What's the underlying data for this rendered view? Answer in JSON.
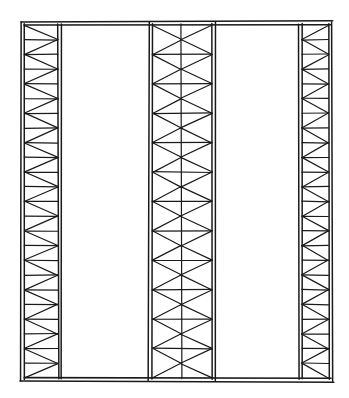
{
  "figure": {
    "description": "Hand-drawn line sketch of a rectangular frame divided by three vertical truss columns",
    "background": "#ffffff",
    "ink_color": "#1a1a1a",
    "canvas": {
      "width": 349,
      "height": 398
    },
    "frame": {
      "left": 21,
      "right": 333,
      "top": 22,
      "bottom": 381,
      "double_line_gap": 3
    },
    "panels": 12,
    "trusses": [
      {
        "name": "left-truss",
        "type": "zigzag",
        "x_outer": 21,
        "x_inner": 58,
        "apex_side": "right"
      },
      {
        "name": "middle-truss",
        "type": "x-brace",
        "x_left": 149,
        "x_right": 212,
        "center_line": 181
      },
      {
        "name": "right-truss",
        "type": "zigzag",
        "x_outer": 332,
        "x_inner": 302,
        "apex_side": "left"
      }
    ],
    "open_bays": [
      {
        "name": "left-bay",
        "x_from": 61,
        "x_to": 146
      },
      {
        "name": "right-bay",
        "x_from": 215,
        "x_to": 299
      }
    ]
  }
}
